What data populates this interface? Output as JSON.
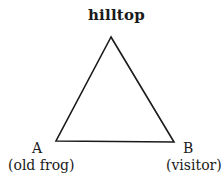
{
  "diagram": {
    "type": "triangle",
    "stroke_color": "#1a1a1a",
    "vertices": {
      "top": {
        "x": 111,
        "y": 37,
        "label": "hilltop"
      },
      "left": {
        "x": 56,
        "y": 141,
        "letter": "A",
        "description": "(old frog)"
      },
      "right": {
        "x": 174,
        "y": 142,
        "letter": "B",
        "description": "(visitor)"
      }
    }
  }
}
